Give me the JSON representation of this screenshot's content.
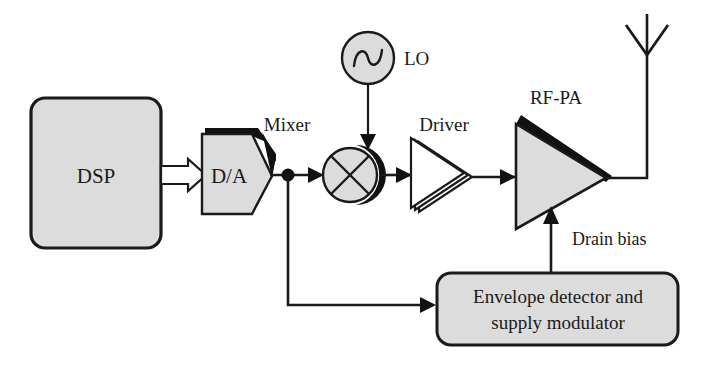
{
  "diagram": {
    "colors": {
      "block_fill": "#dcdcdc",
      "stroke": "#1a1a1a",
      "shadow": "#111111",
      "background": "#ffffff"
    },
    "blocks": {
      "dsp": {
        "label": "DSP"
      },
      "da": {
        "label": "D/A"
      },
      "mixer": {
        "label": "Mixer"
      },
      "lo": {
        "label": "LO"
      },
      "driver": {
        "label": "Driver"
      },
      "rfpa": {
        "label": "RF-PA"
      },
      "envelope": {
        "line1": "Envelope detector and",
        "line2": "supply modulator"
      },
      "drain_bias": {
        "label": "Drain bias"
      },
      "antenna": {
        "label": "antenna"
      }
    },
    "icons": {
      "dsp": "rounded-rectangle-block-icon",
      "da": "hexagon-converter-icon",
      "lo": "sine-wave-oscillator-icon",
      "mixer": "mixer-multiplier-icon",
      "driver": "stacked-amplifier-triangle-icon",
      "rfpa": "power-amplifier-triangle-icon",
      "antenna": "antenna-icon",
      "junction": "junction-dot-icon",
      "bus_arrow": "hollow-block-arrow-icon"
    }
  }
}
